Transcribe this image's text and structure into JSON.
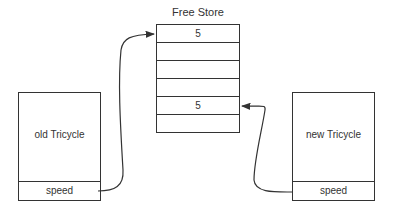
{
  "free_store": {
    "title": "Free Store",
    "cells": [
      "5",
      "",
      "",
      "",
      "5",
      ""
    ]
  },
  "old_object": {
    "label": "old Tricycle",
    "field": "speed"
  },
  "new_object": {
    "label": "new Tricycle",
    "field": "speed"
  },
  "colors": {
    "line": "#333333",
    "background": "#ffffff"
  }
}
